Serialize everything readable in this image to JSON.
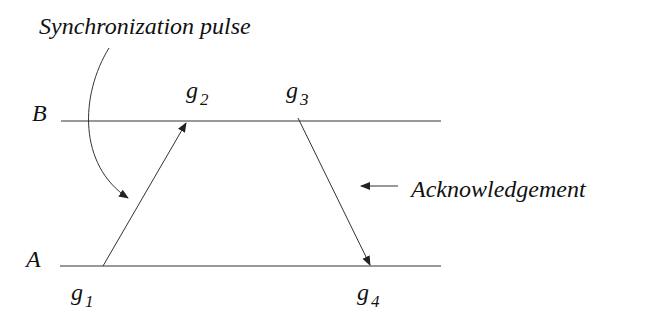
{
  "diagram": {
    "title_label": "Synchronization pulse",
    "ack_label": "Acknowledgement",
    "lines": [
      {
        "name": "B",
        "label": "B"
      },
      {
        "name": "A",
        "label": "A"
      }
    ],
    "events": [
      {
        "id": "g1",
        "base": "g",
        "sub": "1"
      },
      {
        "id": "g2",
        "base": "g",
        "sub": "2"
      },
      {
        "id": "g3",
        "base": "g",
        "sub": "3"
      },
      {
        "id": "g4",
        "base": "g",
        "sub": "4"
      }
    ],
    "stroke_color": "#333333"
  }
}
